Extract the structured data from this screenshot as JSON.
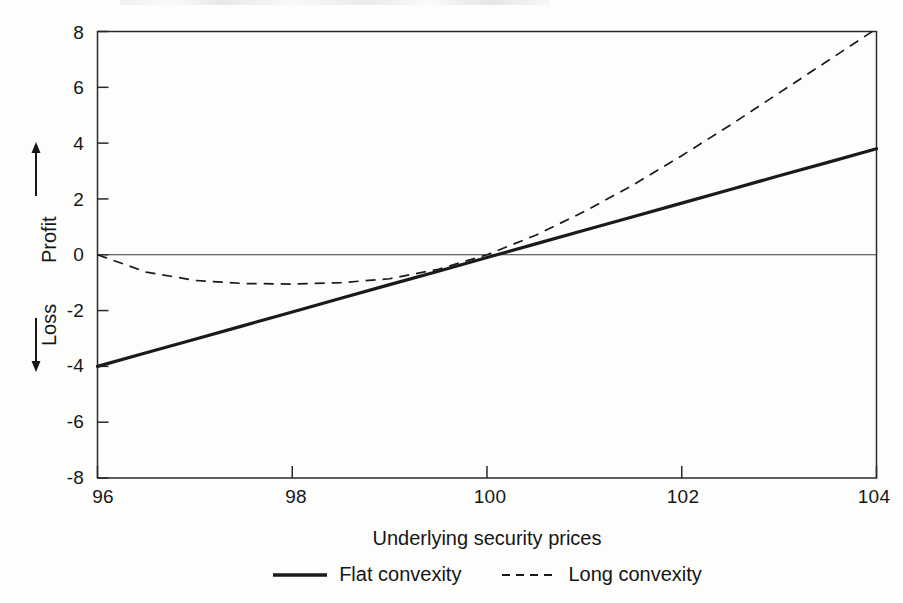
{
  "figure": {
    "background_color": "#fdfdfc",
    "ink_color": "#1a1a1a"
  },
  "axes": {
    "y_title_top": "Profit",
    "y_title_bottom": "Loss",
    "y_arrow_up": "up-arrow",
    "y_arrow_down": "down-arrow",
    "x_title": "Underlying security prices",
    "y_ticks": [
      "8",
      "6",
      "4",
      "2",
      "0",
      "-2",
      "-4",
      "-6",
      "-8"
    ],
    "x_ticks": [
      "96",
      "98",
      "100",
      "102",
      "104"
    ]
  },
  "legend": {
    "items": [
      {
        "label": "Flat convexity",
        "style": "solid",
        "color": "#1a1a1a"
      },
      {
        "label": "Long convexity",
        "style": "dashed",
        "color": "#1a1a1a"
      }
    ]
  },
  "chart_data": {
    "type": "line",
    "title": "",
    "subtitle": "",
    "xlabel": "Underlying security prices",
    "ylabel": "Profit / Loss",
    "xlim": [
      96,
      104
    ],
    "ylim": [
      -8,
      8
    ],
    "xticks": [
      96,
      98,
      100,
      102,
      104
    ],
    "yticks": [
      -8,
      -6,
      -4,
      -2,
      0,
      2,
      4,
      6,
      8
    ],
    "grid": false,
    "zero_reference_line": 0,
    "legend_position": "below-axis-center",
    "x": [
      96,
      96.5,
      97,
      97.5,
      98,
      98.5,
      99,
      99.5,
      100,
      100.5,
      101,
      101.5,
      102,
      102.5,
      103,
      103.5,
      104
    ],
    "series": [
      {
        "name": "Flat convexity",
        "style": "solid",
        "linewidth": 3.2,
        "color": "#1a1a1a",
        "values": [
          -4.0,
          -3.51,
          -3.03,
          -2.54,
          -2.05,
          -1.56,
          -1.07,
          -0.59,
          -0.1,
          0.39,
          0.88,
          1.36,
          1.85,
          2.34,
          2.83,
          3.31,
          3.8
        ]
      },
      {
        "name": "Long convexity",
        "style": "dashed",
        "linewidth": 1.7,
        "color": "#1a1a1a",
        "values": [
          0.0,
          -0.62,
          -0.92,
          -1.03,
          -1.05,
          -1.0,
          -0.86,
          -0.52,
          0.0,
          0.7,
          1.55,
          2.5,
          3.55,
          4.65,
          5.8,
          6.95,
          8.1
        ]
      }
    ],
    "annotations": [
      {
        "text": "Both strategies break even at 100",
        "x": 100,
        "y": 0
      }
    ]
  }
}
